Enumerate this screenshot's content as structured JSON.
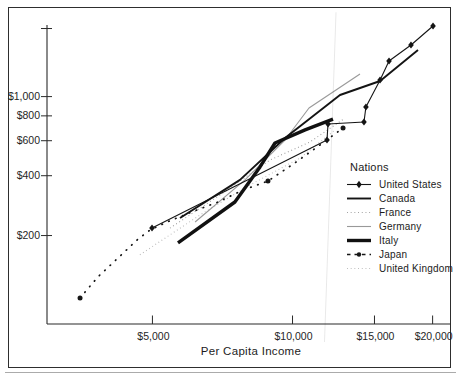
{
  "chart_data": {
    "type": "line",
    "title": "",
    "xlabel": "Per Capita Income",
    "ylabel": "",
    "legend_title": "Nations",
    "x_scale": "log",
    "y_scale": "log",
    "grid": false,
    "legend_position": "right-middle",
    "xlim": [
      3000,
      21900
    ],
    "ylim": [
      72,
      2300
    ],
    "x_ticks": [
      {
        "value": 5000,
        "label": "$5,000"
      },
      {
        "value": 10000,
        "label": "$10,000"
      },
      {
        "value": 15000,
        "label": "$15,000"
      },
      {
        "value": 20000,
        "label": "$20,000"
      }
    ],
    "y_ticks": [
      {
        "value": 200,
        "label": "$200"
      },
      {
        "value": 400,
        "label": "$400"
      },
      {
        "value": 600,
        "label": "$600"
      },
      {
        "value": 800,
        "label": "$800"
      },
      {
        "value": 1000,
        "label": "$1,000"
      },
      {
        "value": 2200,
        "label": ""
      }
    ],
    "series": [
      {
        "name": "France",
        "style": {
          "color": "#9a9a9a",
          "width": 1.1,
          "dash": "0.9 2.8",
          "marker": "none"
        },
        "points": [
          [
            5455,
            218
          ],
          [
            6985,
            320
          ],
          [
            8945,
            480
          ],
          [
            10905,
            591
          ],
          [
            12965,
            780
          ]
        ]
      },
      {
        "name": "United Kingdom",
        "style": {
          "color": "#b8b8b8",
          "width": 1.1,
          "dash": "0.9 2.8",
          "marker": "none"
        },
        "points": [
          [
            4700,
            160
          ],
          [
            6330,
            254
          ],
          [
            8100,
            359
          ],
          [
            10380,
            491
          ],
          [
            12340,
            679
          ]
        ]
      },
      {
        "name": "Germany",
        "style": {
          "color": "#999999",
          "width": 1.1,
          "dash": "",
          "marker": "none"
        },
        "points": [
          [
            6175,
            234
          ],
          [
            7905,
            381
          ],
          [
            9635,
            605
          ],
          [
            10850,
            876
          ],
          [
            13960,
            1299
          ]
        ]
      },
      {
        "name": "Japan",
        "style": {
          "color": "#161616",
          "width": 1.7,
          "dash": "0.6 6.8",
          "linecap": "round",
          "marker": "circle",
          "marker_size": 2.5,
          "marker_indices": [
            0,
            9,
            12
          ]
        },
        "points": [
          [
            3495,
            97
          ],
          [
            3820,
            124
          ],
          [
            4215,
            154
          ],
          [
            4655,
            192
          ],
          [
            4940,
            213
          ],
          [
            5375,
            234
          ],
          [
            6080,
            263
          ],
          [
            6915,
            295
          ],
          [
            7830,
            339
          ],
          [
            8855,
            376
          ],
          [
            10120,
            464
          ],
          [
            11455,
            571
          ],
          [
            12840,
            695
          ]
        ]
      },
      {
        "name": "Canada",
        "style": {
          "color": "#141414",
          "width": 1.9,
          "dash": "",
          "marker": "none"
        },
        "points": [
          [
            5730,
            245
          ],
          [
            7710,
            381
          ],
          [
            9635,
            619
          ],
          [
            12650,
            1019
          ],
          [
            15420,
            1198
          ],
          [
            18600,
            1716
          ]
        ]
      },
      {
        "name": "Italy",
        "style": {
          "color": "#111111",
          "width": 3.4,
          "dash": "",
          "marker": "none"
        },
        "points": [
          [
            5675,
            184
          ],
          [
            7520,
            295
          ],
          [
            8515,
            443
          ],
          [
            9170,
            584
          ],
          [
            10640,
            680
          ],
          [
            12220,
            771
          ]
        ]
      },
      {
        "name": "United States",
        "style": {
          "color": "#151515",
          "width": 1.1,
          "dash": "",
          "marker": "diamond",
          "marker_size": 3.1
        },
        "points": [
          [
            4990,
            218
          ],
          [
            11860,
            605
          ],
          [
            11920,
            728
          ],
          [
            14240,
            745
          ],
          [
            14380,
            887
          ],
          [
            15420,
            1212
          ],
          [
            16120,
            1510
          ],
          [
            17970,
            1818
          ],
          [
            20040,
            2265
          ]
        ]
      }
    ],
    "legend_order": [
      "United States",
      "Canada",
      "France",
      "Germany",
      "Italy",
      "Japan",
      "United Kingdom"
    ]
  }
}
